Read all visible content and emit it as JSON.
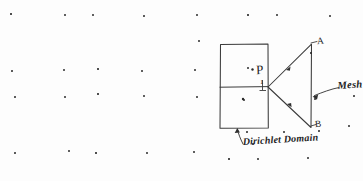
{
  "figure": {
    "kind": "hand-drawn-scanned-diagram",
    "background_color": "#fdfdfd",
    "ink_color": "#2b2b2b",
    "labels": {
      "dirichlet_domain": "Dirichlet Domain",
      "mesh": "Mesh",
      "point_p": "P",
      "vertex_top": "A",
      "vertex_bottom": "B",
      "midpoint_tick": "1"
    },
    "shapes": {
      "rectangle": {
        "name": "dirichlet-domain-rectangle",
        "x": 220,
        "y": 44,
        "width": 48,
        "height": 84,
        "divider_y": 87
      },
      "triangle": {
        "name": "mesh-triangle",
        "points": "268,87 311,44 311,127"
      }
    },
    "leaders": [
      {
        "name": "dirichlet-leader",
        "from": [
          243,
          143
        ],
        "to": [
          237,
          129
        ]
      },
      {
        "name": "mesh-leader",
        "from": [
          338,
          88
        ],
        "to": [
          313,
          96
        ]
      }
    ],
    "specks": [
      [
        10,
        13
      ],
      [
        64,
        14
      ],
      [
        92,
        14
      ],
      [
        143,
        15
      ],
      [
        196,
        14
      ],
      [
        247,
        14
      ],
      [
        276,
        14
      ],
      [
        329,
        15
      ],
      [
        11,
        70
      ],
      [
        63,
        69
      ],
      [
        97,
        68
      ],
      [
        141,
        70
      ],
      [
        194,
        69
      ],
      [
        14,
        96
      ],
      [
        64,
        96
      ],
      [
        97,
        93
      ],
      [
        143,
        95
      ],
      [
        196,
        96
      ],
      [
        14,
        152
      ],
      [
        68,
        150
      ],
      [
        95,
        152
      ],
      [
        146,
        152
      ],
      [
        193,
        151
      ],
      [
        246,
        131
      ],
      [
        283,
        131
      ],
      [
        228,
        158
      ],
      [
        257,
        158
      ],
      [
        307,
        157
      ],
      [
        318,
        130
      ],
      [
        314,
        98
      ],
      [
        310,
        52
      ],
      [
        247,
        67
      ],
      [
        243,
        99
      ],
      [
        353,
        95
      ],
      [
        348,
        125
      ],
      [
        252,
        143
      ],
      [
        198,
        40
      ]
    ]
  }
}
